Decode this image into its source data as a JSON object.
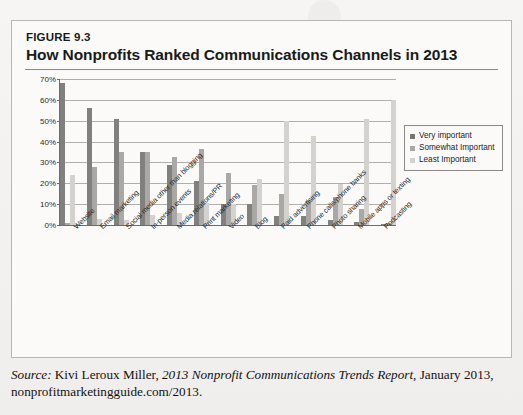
{
  "figure": {
    "number_label": "FIGURE 9.3",
    "title": "How Nonprofits Ranked Communications Channels in 2013"
  },
  "legend": {
    "items": [
      {
        "label": "Very important",
        "color": "#77766f"
      },
      {
        "label": "Somewhat Important",
        "color": "#a9a8a5"
      },
      {
        "label": "Least Important",
        "color": "#d3d2cf"
      }
    ]
  },
  "source": {
    "prefix": "Source:",
    "author": "Kivi Leroux Miller,",
    "report": "2013 Nonprofit Communications Trends Report",
    "tail": ", January 2013, nonprofitmarketingguide.com/2013."
  },
  "chart_data": {
    "type": "bar",
    "title": "How Nonprofits Ranked Communications Channels in 2013",
    "xlabel": "",
    "ylabel": "",
    "ylim": [
      0,
      70
    ],
    "ytick_labels": [
      "0%",
      "10%",
      "20%",
      "30%",
      "40%",
      "50%",
      "60%",
      "70%"
    ],
    "ytick_values": [
      0,
      10,
      20,
      30,
      40,
      50,
      60,
      70
    ],
    "grid": true,
    "legend_position": "right",
    "categories": [
      "Website",
      "Email marketing",
      "Social media other than blogging",
      "In-person events",
      "Media relations/PR",
      "Print marketing",
      "Video",
      "Blog",
      "Paid advertising",
      "Phone calls/phone banks",
      "Photo sharing",
      "Mobile apps or texting",
      "Podcasting"
    ],
    "series": [
      {
        "name": "Very important",
        "color": "#80807e",
        "values": [
          68,
          56,
          51,
          35,
          29,
          21,
          10,
          10,
          4.5,
          4.5,
          2.5,
          1.5,
          0.5
        ]
      },
      {
        "name": "Somewhat Important",
        "color": "#a9a8a5",
        "values": [
          1,
          28,
          35,
          35,
          32.5,
          36.5,
          25,
          19,
          15,
          12,
          13.5,
          7.5,
          1
        ]
      },
      {
        "name": "Least Important",
        "color": "#d3d2cf",
        "values": [
          24,
          3,
          2.5,
          5,
          6,
          10.5,
          10,
          22,
          50,
          42.5,
          19.5,
          51,
          60
        ]
      }
    ]
  }
}
